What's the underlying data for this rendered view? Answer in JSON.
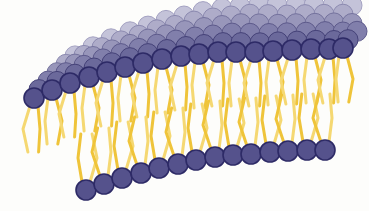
{
  "illustration": {
    "subject": "lipid-bilayer",
    "colors": {
      "background": "#fdfdfb",
      "head_fill": "#55528c",
      "head_outline": "#2d2a66",
      "head_back_fill": "#c9c8dc",
      "head_back_outline": "#a9a7c6",
      "tail": "#efc43a",
      "tail_light": "#f5d872"
    },
    "head_radius": 10,
    "top_front_row": [
      [
        34,
        98
      ],
      [
        52,
        90
      ],
      [
        70,
        83
      ],
      [
        89,
        77
      ],
      [
        107,
        72
      ],
      [
        125,
        67
      ],
      [
        143,
        63
      ],
      [
        162,
        59
      ],
      [
        181,
        56
      ],
      [
        199,
        54
      ],
      [
        218,
        52
      ],
      [
        236,
        52
      ],
      [
        255,
        52
      ],
      [
        273,
        51
      ],
      [
        292,
        50
      ],
      [
        311,
        49
      ],
      [
        329,
        49
      ],
      [
        343,
        48
      ]
    ],
    "bottom_row": [
      [
        86,
        190
      ],
      [
        104,
        184
      ],
      [
        122,
        178
      ],
      [
        141,
        173
      ],
      [
        159,
        168
      ],
      [
        178,
        164
      ],
      [
        196,
        160
      ],
      [
        215,
        157
      ],
      [
        233,
        155
      ],
      [
        251,
        154
      ],
      [
        270,
        152
      ],
      [
        288,
        151
      ],
      [
        307,
        150
      ],
      [
        325,
        150
      ]
    ],
    "back_rows": 5
  }
}
